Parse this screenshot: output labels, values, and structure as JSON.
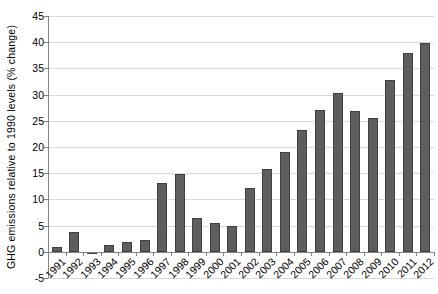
{
  "chart_data": {
    "type": "bar",
    "title": "",
    "xlabel": "",
    "ylabel": "GHG emissions relative to 1990 levels (% change)",
    "categories": [
      "1991",
      "1992",
      "1993",
      "1994",
      "1995",
      "1996",
      "1997",
      "1998",
      "1999",
      "2000",
      "2001",
      "2002",
      "2003",
      "2004",
      "2005",
      "2006",
      "2007",
      "2008",
      "2009",
      "2010",
      "2011",
      "2012"
    ],
    "values": [
      0.9,
      3.8,
      -0.3,
      1.3,
      1.9,
      2.3,
      13.2,
      14.8,
      6.4,
      5.5,
      5.0,
      12.2,
      15.8,
      19.1,
      23.2,
      27.0,
      30.4,
      26.8,
      25.5,
      32.8,
      38.0,
      39.8
    ],
    "ylim": [
      -5,
      45
    ],
    "yticks": [
      45,
      40,
      35,
      30,
      25,
      20,
      15,
      10,
      5,
      0,
      -5
    ],
    "xtick_rotation_deg": 45,
    "grid": "horizontal",
    "legend": "none",
    "colors": {
      "bar_fill": "#5e5e5e",
      "bar_border": "#3f3f3f",
      "gridline": "#d9d9d9",
      "axis": "#848484",
      "text": "#000000",
      "background": "#ffffff"
    }
  }
}
